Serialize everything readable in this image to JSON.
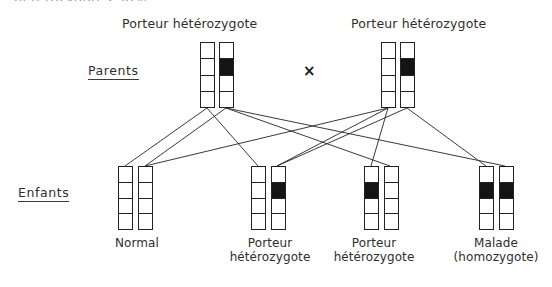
{
  "diagram": {
    "title_partial": "hétérozygotes 50%",
    "cross_symbol": "×",
    "row_labels": {
      "parents": "Parents",
      "children": "Enfants"
    },
    "colors": {
      "stroke": "#222222",
      "allele_mutant": "#141414",
      "allele_normal": "#ffffff",
      "background": "#ffffff",
      "text": "#2e2e2e"
    },
    "segments_per_chromosome": 4,
    "parents": [
      {
        "label": "Porteur hétérozygote",
        "chromosomes": [
          {
            "name": "chromosome-left",
            "segments": [
              "normal",
              "normal",
              "normal",
              "normal"
            ]
          },
          {
            "name": "chromosome-right",
            "segments": [
              "normal",
              "mutant",
              "normal",
              "normal"
            ]
          }
        ]
      },
      {
        "label": "Porteur hétérozygote",
        "chromosomes": [
          {
            "name": "chromosome-left",
            "segments": [
              "normal",
              "normal",
              "normal",
              "normal"
            ]
          },
          {
            "name": "chromosome-right",
            "segments": [
              "normal",
              "mutant",
              "normal",
              "normal"
            ]
          }
        ]
      }
    ],
    "children": [
      {
        "caption_line1": "Normal",
        "caption_line2": "",
        "chromosomes": [
          {
            "name": "chromosome-left",
            "segments": [
              "normal",
              "normal",
              "normal",
              "normal"
            ]
          },
          {
            "name": "chromosome-right",
            "segments": [
              "normal",
              "normal",
              "normal",
              "normal"
            ]
          }
        ]
      },
      {
        "caption_line1": "Porteur",
        "caption_line2": "hétérozygote",
        "chromosomes": [
          {
            "name": "chromosome-left",
            "segments": [
              "normal",
              "normal",
              "normal",
              "normal"
            ]
          },
          {
            "name": "chromosome-right",
            "segments": [
              "normal",
              "mutant",
              "normal",
              "normal"
            ]
          }
        ]
      },
      {
        "caption_line1": "Porteur",
        "caption_line2": "hétérozygote",
        "chromosomes": [
          {
            "name": "chromosome-left",
            "segments": [
              "normal",
              "mutant",
              "normal",
              "normal"
            ]
          },
          {
            "name": "chromosome-right",
            "segments": [
              "normal",
              "normal",
              "normal",
              "normal"
            ]
          }
        ]
      },
      {
        "caption_line1": "Malade",
        "caption_line2": "(homozygote)",
        "chromosomes": [
          {
            "name": "chromosome-left",
            "segments": [
              "normal",
              "mutant",
              "normal",
              "normal"
            ]
          },
          {
            "name": "chromosome-right",
            "segments": [
              "normal",
              "mutant",
              "normal",
              "normal"
            ]
          }
        ]
      }
    ]
  }
}
